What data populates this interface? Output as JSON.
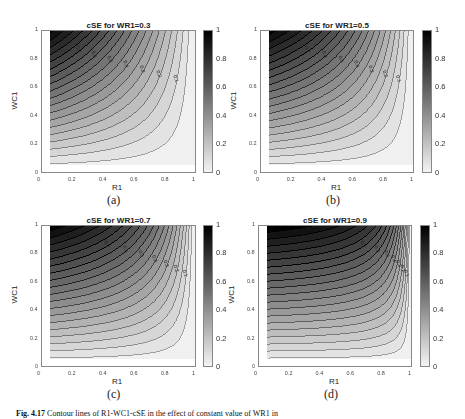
{
  "figure": {
    "caption_label": "Fig. 4.17",
    "caption_text": "Contour lines of R1-WC1-cSE in the effect of constant value of WR1 in"
  },
  "panels": [
    {
      "id": "a",
      "sublabel": "(a)",
      "title": "cSE for WR1=0.3",
      "wr1": 0.3
    },
    {
      "id": "b",
      "sublabel": "(b)",
      "title": "cSE for WR1=0.5",
      "wr1": 0.5
    },
    {
      "id": "c",
      "sublabel": "(c)",
      "title": "cSE for WR1=0.7",
      "wr1": 0.7
    },
    {
      "id": "d",
      "sublabel": "(d)",
      "title": "cSE for WR1=0.9",
      "wr1": 0.9
    }
  ],
  "axes": {
    "xlabel": "R1",
    "ylabel": "WC1",
    "xticks": [
      "0",
      "0.2",
      "0.4",
      "0.6",
      "0.8",
      "1"
    ],
    "yticks": [
      "0",
      "0.2",
      "0.4",
      "0.6",
      "0.8",
      "1"
    ],
    "colorbar_ticks": [
      "0",
      "0.2",
      "0.4",
      "0.6",
      "0.8",
      "1"
    ]
  },
  "chart_data": [
    {
      "type": "contour",
      "title": "cSE for WR1=0.3",
      "xlabel": "R1",
      "ylabel": "WC1",
      "xlim": [
        0,
        1
      ],
      "ylim": [
        0,
        1
      ],
      "data_range_x": [
        0.05,
        1
      ],
      "data_range_y": [
        0.05,
        1
      ],
      "colorbar": {
        "range": [
          0,
          1
        ],
        "ticks": [
          0,
          0.2,
          0.4,
          0.6,
          0.8,
          1
        ],
        "colormap": "gray-reversed"
      },
      "contour_levels": [
        0.05,
        0.1,
        0.15,
        0.2,
        0.25,
        0.3,
        0.35,
        0.4,
        0.45,
        0.5,
        0.55,
        0.6,
        0.65,
        0.7,
        0.75,
        0.8,
        0.85,
        0.9,
        0.95
      ],
      "contour_labels": [
        "0.7",
        "0.6",
        "0.5",
        "0.4",
        "0.3",
        "0.2",
        "0.1"
      ],
      "wr1": 0.3
    },
    {
      "type": "contour",
      "title": "cSE for WR1=0.5",
      "xlabel": "R1",
      "ylabel": "WC1",
      "xlim": [
        0,
        1
      ],
      "ylim": [
        0,
        1
      ],
      "data_range_x": [
        0.05,
        1
      ],
      "data_range_y": [
        0.05,
        1
      ],
      "colorbar": {
        "range": [
          0,
          1
        ],
        "ticks": [
          0,
          0.2,
          0.4,
          0.6,
          0.8,
          1
        ],
        "colormap": "gray-reversed"
      },
      "contour_levels": [
        0.05,
        0.1,
        0.15,
        0.2,
        0.25,
        0.3,
        0.35,
        0.4,
        0.45,
        0.5,
        0.55,
        0.6,
        0.65,
        0.7,
        0.75,
        0.8,
        0.85,
        0.9,
        0.95
      ],
      "contour_labels": [
        "0.7",
        "0.6",
        "0.5",
        "0.4",
        "0.3",
        "0.2",
        "0.1"
      ],
      "wr1": 0.5
    },
    {
      "type": "contour",
      "title": "cSE for WR1=0.7",
      "xlabel": "R1",
      "ylabel": "WC1",
      "xlim": [
        0,
        1
      ],
      "ylim": [
        0,
        1
      ],
      "data_range_x": [
        0.05,
        1
      ],
      "data_range_y": [
        0.05,
        1
      ],
      "colorbar": {
        "range": [
          0,
          1
        ],
        "ticks": [
          0,
          0.2,
          0.4,
          0.6,
          0.8,
          1
        ],
        "colormap": "gray-reversed"
      },
      "contour_levels": [
        0.05,
        0.1,
        0.15,
        0.2,
        0.25,
        0.3,
        0.35,
        0.4,
        0.45,
        0.5,
        0.55,
        0.6,
        0.65,
        0.7,
        0.75,
        0.8,
        0.85,
        0.9,
        0.95
      ],
      "contour_labels": [
        "0.7",
        "0.6",
        "0.5",
        "0.4",
        "0.3",
        "0.2",
        "0.1"
      ],
      "wr1": 0.7
    },
    {
      "type": "contour",
      "title": "cSE for WR1=0.9",
      "xlabel": "R1",
      "ylabel": "WC1",
      "xlim": [
        0,
        1
      ],
      "ylim": [
        0,
        1
      ],
      "data_range_x": [
        0.05,
        1
      ],
      "data_range_y": [
        0.05,
        1
      ],
      "colorbar": {
        "range": [
          0,
          1
        ],
        "ticks": [
          0,
          0.2,
          0.4,
          0.6,
          0.8,
          1
        ],
        "colormap": "gray-reversed"
      },
      "contour_levels": [
        0.05,
        0.1,
        0.15,
        0.2,
        0.25,
        0.3,
        0.35,
        0.4,
        0.45,
        0.5,
        0.55,
        0.6,
        0.65,
        0.7,
        0.75,
        0.8,
        0.85,
        0.9,
        0.95
      ],
      "contour_labels": [
        "0.7",
        "0.6",
        "0.5",
        "0.4",
        "0.3",
        "0.2",
        "0.1"
      ],
      "wr1": 0.9
    }
  ]
}
